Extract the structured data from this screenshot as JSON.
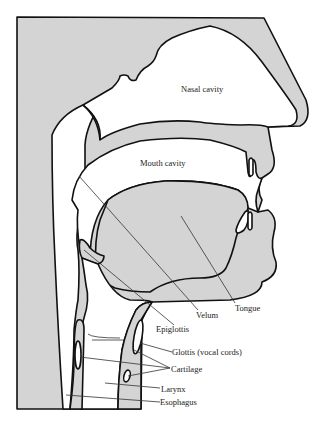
{
  "diagram": {
    "type": "anatomical cross-section",
    "colors": {
      "tissue": "#d4d4d4",
      "cavity": "#ffffff",
      "outline": "#111111"
    },
    "regions": {
      "nasal_cavity": "Nasal cavity",
      "mouth_cavity": "Mouth cavity"
    },
    "labels": [
      {
        "id": "velum",
        "text": "Velum"
      },
      {
        "id": "tongue",
        "text": "Tongue"
      },
      {
        "id": "epiglottis",
        "text": "Epiglottis"
      },
      {
        "id": "glottis",
        "text": "Glottis (vocal cords)"
      },
      {
        "id": "cartilage",
        "text": "Cartilage"
      },
      {
        "id": "larynx",
        "text": "Larynx"
      },
      {
        "id": "esophagus",
        "text": "Esophagus"
      }
    ]
  }
}
